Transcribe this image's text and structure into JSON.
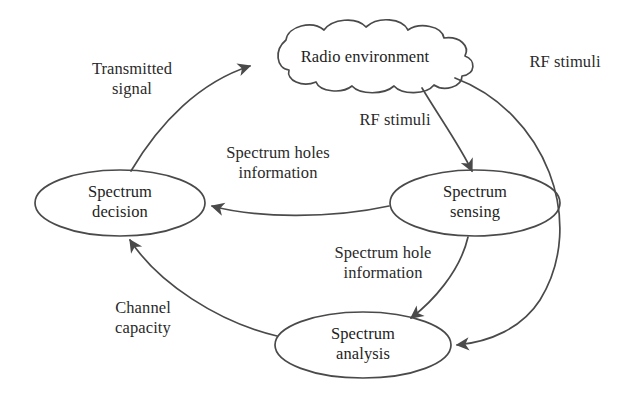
{
  "diagram": {
    "stroke_color": "#4a4a4a",
    "text_color": "#1d1d1d",
    "background": "#ffffff",
    "nodes": [
      {
        "id": "radio-environment",
        "shape": "cloud",
        "label": "Radio environment",
        "cx": 365,
        "cy": 58
      },
      {
        "id": "spectrum-decision",
        "shape": "ellipse",
        "label": "Spectrum\ndecision",
        "cx": 120,
        "cy": 203
      },
      {
        "id": "spectrum-sensing",
        "shape": "ellipse",
        "label": "Spectrum\nsensing",
        "cx": 475,
        "cy": 203
      },
      {
        "id": "spectrum-analysis",
        "shape": "ellipse",
        "label": "Spectrum\nanalysis",
        "cx": 363,
        "cy": 345
      }
    ],
    "edges": [
      {
        "id": "transmitted-signal",
        "label": "Transmitted\nsignal",
        "from": "spectrum-decision",
        "to": "radio-environment"
      },
      {
        "id": "rf-stimuli-outer",
        "label": "RF stimuli",
        "from": "radio-environment",
        "to": "spectrum-analysis"
      },
      {
        "id": "rf-stimuli-inner",
        "label": "RF stimuli",
        "from": "radio-environment",
        "to": "spectrum-sensing"
      },
      {
        "id": "spectrum-holes-info",
        "label": "Spectrum holes\ninformation",
        "from": "spectrum-sensing",
        "to": "spectrum-decision"
      },
      {
        "id": "spectrum-hole-info",
        "label": "Spectrum hole\ninformation",
        "from": "spectrum-sensing",
        "to": "spectrum-analysis"
      },
      {
        "id": "channel-capacity",
        "label": "Channel\ncapacity",
        "from": "spectrum-analysis",
        "to": "spectrum-decision"
      }
    ]
  }
}
